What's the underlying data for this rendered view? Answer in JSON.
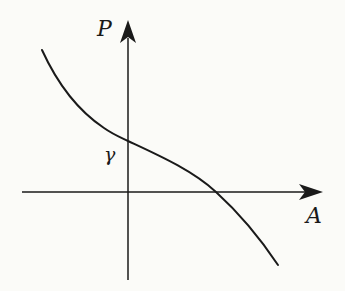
{
  "diagram": {
    "type": "function-graph",
    "colors": {
      "background": "#fbfbf8",
      "line": "#1a1a1a"
    },
    "axes": {
      "x": {
        "label": "A",
        "direction": "right"
      },
      "y": {
        "label": "P",
        "direction": "up"
      }
    },
    "intercept_label": "γ",
    "curve": {
      "shape": "monotonically decreasing, concave-up on left, inflection near P-intercept, concave-down on right",
      "points_px": [
        [
          42,
          50
        ],
        [
          128,
          141
        ],
        [
          216,
          192
        ],
        [
          278,
          265
        ]
      ]
    }
  }
}
